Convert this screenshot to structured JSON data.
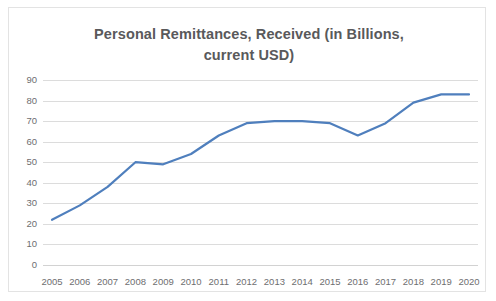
{
  "chart_data": {
    "type": "line",
    "title": "Personal Remittances, Received (in Billions, current USD)",
    "title_line1": "Personal Remittances, Received (in Billions,",
    "title_line2": "current USD)",
    "xlabel": "",
    "ylabel": "",
    "categories": [
      "2005",
      "2006",
      "2007",
      "2008",
      "2009",
      "2010",
      "2011",
      "2012",
      "2013",
      "2014",
      "2015",
      "2016",
      "2017",
      "2018",
      "2019",
      "2020"
    ],
    "values": [
      22,
      29,
      38,
      50,
      49,
      54,
      63,
      69,
      70,
      70,
      69,
      63,
      69,
      79,
      83,
      83
    ],
    "series": [
      {
        "name": "Personal Remittances, Received (in Billions, current USD)",
        "values": [
          22,
          29,
          38,
          50,
          49,
          54,
          63,
          69,
          70,
          70,
          69,
          63,
          69,
          79,
          83,
          83
        ],
        "color": "#4f7fbd"
      }
    ],
    "ylim": [
      0,
      90
    ],
    "yticks": [
      0,
      10,
      20,
      30,
      40,
      50,
      60,
      70,
      80,
      90
    ],
    "ytick_labels": [
      "0",
      "10",
      "20",
      "30",
      "40",
      "50",
      "60",
      "70",
      "80",
      "90"
    ],
    "grid": true,
    "grid_axis": "y",
    "legend": false,
    "legend_position": "none",
    "markers": false,
    "line_width": 2.2,
    "plot_background": "#ffffff",
    "grid_color": "#dcdcdc",
    "axis_label_color": "#6e6e70",
    "title_color": "#59595b",
    "border_color": "#e3e3e3"
  }
}
